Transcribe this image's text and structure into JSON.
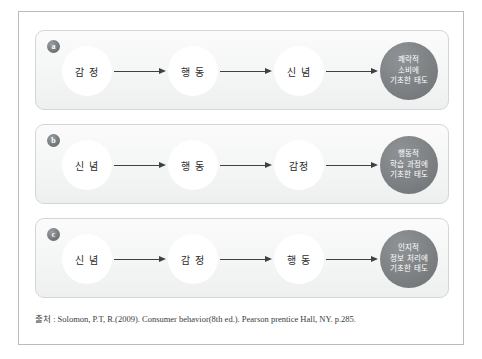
{
  "figure": {
    "rows": [
      {
        "badge": "a",
        "nodes": [
          "감 정",
          "행 동",
          "신 념"
        ],
        "outcome_lines": [
          "쾌락적",
          "소비에",
          "기초한 태도"
        ]
      },
      {
        "badge": "b",
        "nodes": [
          "신 념",
          "행 동",
          "감정"
        ],
        "outcome_lines": [
          "행동적",
          "학습 과정에",
          "기초한 태도"
        ]
      },
      {
        "badge": "c",
        "nodes": [
          "신 념",
          "감 정",
          "행 동"
        ],
        "outcome_lines": [
          "인지적",
          "정보 처리에",
          "기초한 태도"
        ]
      }
    ],
    "source": "출처 : Solomon, P.T, R.(2009). Consumer behavior(8th ed.). Pearson prentice Hall, NY. p.285.",
    "colors": {
      "frame_border": "#b9bcbe",
      "panel_border": "#d3d6d8",
      "panel_fill": "#f4f5f5",
      "node_ring": "#9ca0a3",
      "node_fill": "#ffffff",
      "outcome_fill": "#7d8184",
      "outcome_text": "#ffffff",
      "arrow": "#3e4142",
      "badge_fill": "#74787a",
      "text": "#2b2b2b"
    }
  }
}
